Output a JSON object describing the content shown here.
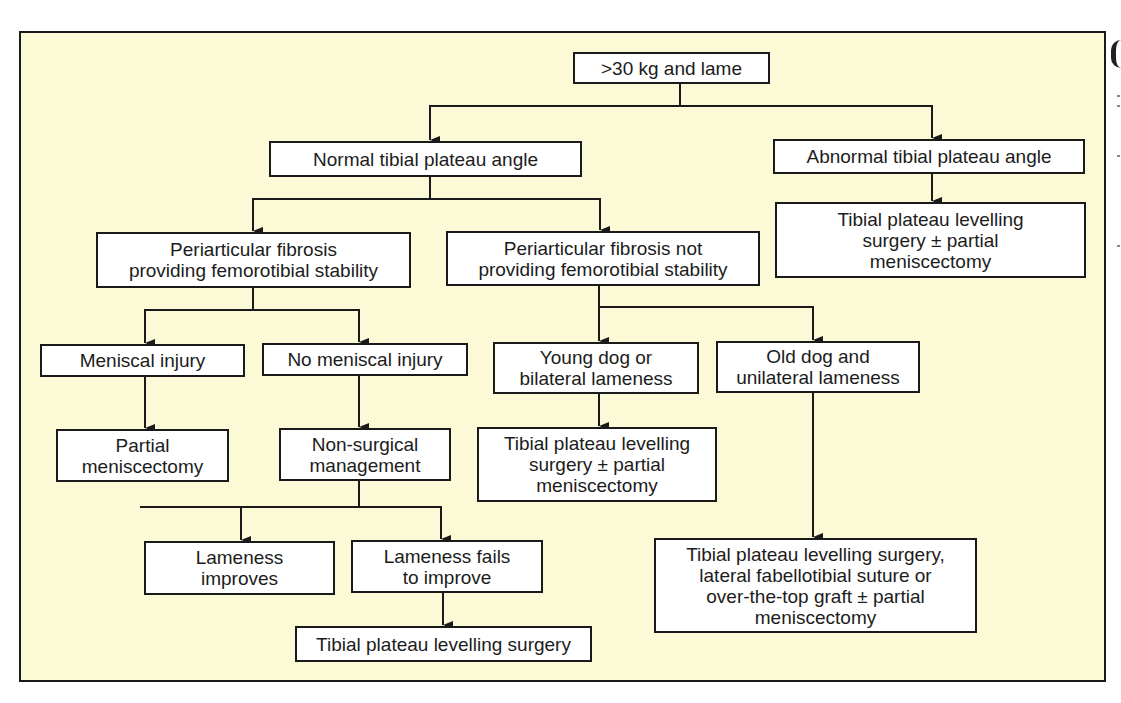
{
  "diagram": {
    "type": "flowchart",
    "background_color": "#fbf9d6",
    "node_fill": "#ffffff",
    "stroke_color": "#1a1a1a",
    "nodes": {
      "root": {
        "label": ">30 kg and lame"
      },
      "normal_tpa": {
        "label": "Normal tibial plateau angle"
      },
      "abnormal_tpa": {
        "label": "Abnormal tibial plateau angle"
      },
      "abnormal_treatment": {
        "label": "Tibial plateau levelling\nsurgery ± partial\nmeniscectomy"
      },
      "fibrosis_stable": {
        "label": "Periarticular fibrosis\nproviding femorotibial stability"
      },
      "fibrosis_unstable": {
        "label": "Periarticular fibrosis not\nproviding femorotibial stability"
      },
      "meniscal_injury": {
        "label": "Meniscal injury"
      },
      "no_meniscal_injury": {
        "label": "No meniscal injury"
      },
      "partial_meniscectomy": {
        "label": "Partial\nmeniscectomy"
      },
      "non_surgical": {
        "label": "Non-surgical\nmanagement"
      },
      "lameness_improves": {
        "label": "Lameness\nimproves"
      },
      "lameness_fails": {
        "label": "Lameness fails\nto improve"
      },
      "tpls_final": {
        "label": "Tibial plateau levelling surgery"
      },
      "young_dog": {
        "label": "Young dog or\nbilateral lameness"
      },
      "young_treatment": {
        "label": "Tibial plateau levelling\nsurgery ± partial\nmeniscectomy"
      },
      "old_dog": {
        "label": "Old dog and\nunilateral lameness"
      },
      "old_treatment": {
        "label": "Tibial plateau levelling surgery,\nlateral fabellotibial suture or\nover-the-top graft ± partial\nmeniscectomy"
      }
    },
    "edges": [
      [
        "root",
        "normal_tpa"
      ],
      [
        "root",
        "abnormal_tpa"
      ],
      [
        "abnormal_tpa",
        "abnormal_treatment"
      ],
      [
        "normal_tpa",
        "fibrosis_stable"
      ],
      [
        "normal_tpa",
        "fibrosis_unstable"
      ],
      [
        "fibrosis_stable",
        "meniscal_injury"
      ],
      [
        "fibrosis_stable",
        "no_meniscal_injury"
      ],
      [
        "meniscal_injury",
        "partial_meniscectomy"
      ],
      [
        "no_meniscal_injury",
        "non_surgical"
      ],
      [
        "non_surgical",
        "lameness_improves"
      ],
      [
        "non_surgical",
        "lameness_fails"
      ],
      [
        "lameness_fails",
        "tpls_final"
      ],
      [
        "fibrosis_unstable",
        "young_dog"
      ],
      [
        "fibrosis_unstable",
        "old_dog"
      ],
      [
        "young_dog",
        "young_treatment"
      ],
      [
        "old_dog",
        "old_treatment"
      ]
    ]
  }
}
